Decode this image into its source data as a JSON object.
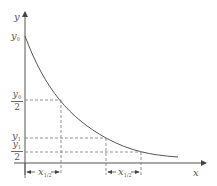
{
  "diagram": {
    "type": "exponential-decay-half-life",
    "axes": {
      "x_label": "x",
      "y_label": "y"
    },
    "y_labels": {
      "y0": {
        "base": "y",
        "sub": "0"
      },
      "y0_half": {
        "num_base": "y",
        "num_sub": "0",
        "den": "2"
      },
      "y1": {
        "base": "y",
        "sub": "1"
      },
      "y1_half": {
        "num_base": "y",
        "num_sub": "1",
        "den": "2"
      }
    },
    "intervals": [
      {
        "base": "x",
        "sub": "1/2"
      },
      {
        "base": "x",
        "sub": "1/2"
      }
    ],
    "colors": {
      "axis": "#555555",
      "curve": "#555555",
      "dashed": "#777777",
      "text": "#555555"
    }
  }
}
